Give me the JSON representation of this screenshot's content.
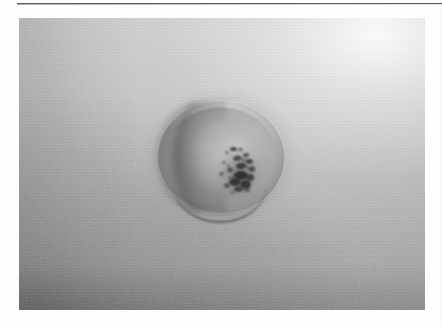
{
  "document": {
    "type": "scanned-figure-page",
    "background_color": "#fefefe",
    "caption": "",
    "page_number": ""
  },
  "rule": {
    "name": "header-rule",
    "color": "#5d5d5d",
    "x": 17,
    "y": 3,
    "width": 425,
    "height": 1
  },
  "photo": {
    "title": "",
    "alt_text": "Grayscale clinical photograph of a circular cutaneous lesion with a raised rim and a dark central crust on pale skin",
    "frame": {
      "x": 19,
      "y": 18,
      "width": 406,
      "height": 292
    },
    "tone": {
      "background_light": "#c9c9c9",
      "background_mid": "#b2b2b2",
      "background_dark": "#9e9e9e",
      "highlight_corner": "#f2f2f2",
      "shadow_corner": "#8a8a8a"
    },
    "lighting": "bright highlight upper-right, shadow falling toward lower-left",
    "grain": "fine film grain"
  },
  "lesion": {
    "name": "skin-lesion",
    "description": "round raised plaque with central dark eschar",
    "shape": "circular",
    "center": {
      "x": 220,
      "y": 156
    },
    "diameter_px": 128,
    "rim_color": "#d2d2d2",
    "body_color": "#ababab",
    "shadow_color": "#6f6f6f",
    "crust": {
      "name": "central-crust",
      "description": "irregular dark crust / eschar",
      "color": "#2b2b2b",
      "center": {
        "x": 239,
        "y": 172
      },
      "width_px": 46,
      "height_px": 50
    }
  },
  "annotations": {
    "labels": [],
    "scale_bar": "",
    "arrows": []
  }
}
